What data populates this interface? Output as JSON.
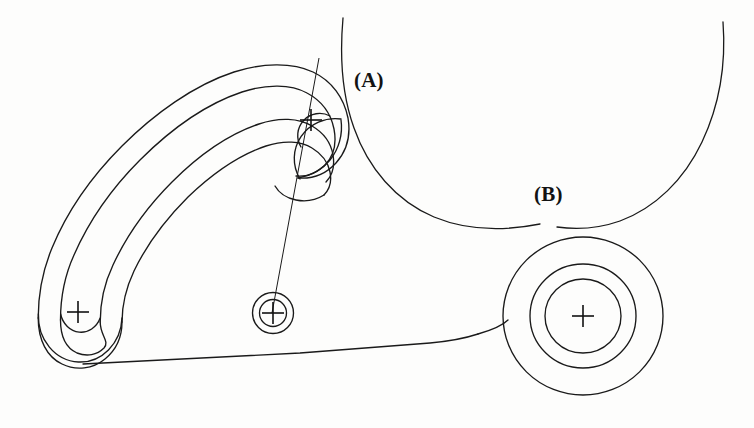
{
  "drawing": {
    "title": "Rocker arm outline with curved slot, pivot bore and circular boss",
    "background_color": "#fdfdfc",
    "line_color": "#1a1a1a",
    "line_width": 1.3,
    "thin_line_width": 1.0,
    "width": 754,
    "height": 428
  },
  "annotations": [
    {
      "id": "a",
      "text": "(A)",
      "x": 354,
      "y": 68,
      "points_to": "tangency-point-upper"
    },
    {
      "id": "b",
      "text": "(B)",
      "x": 534,
      "y": 182,
      "points_to": "tangency-point-lower"
    }
  ],
  "features": {
    "slot_left_end": {
      "center_x": 78,
      "center_y": 312,
      "outer_r": 40,
      "inner_r": 22,
      "cross_size": 11
    },
    "slot_right_end": {
      "center_x": 311,
      "center_y": 120,
      "outer_r": 41,
      "inner_r": 22,
      "cross_size": 11
    },
    "pivot_bore": {
      "center_x": 273,
      "center_y": 313,
      "outer_r": 20,
      "inner_r": 13,
      "cross_size": 11
    },
    "boss": {
      "center_x": 583,
      "center_y": 316,
      "outer_r": 78,
      "middle_r": 52,
      "inner_r": 37,
      "cross_size": 11
    },
    "construction_line": {
      "x1": 319,
      "y1": 58,
      "x2": 272,
      "y2": 313
    },
    "large_arc_left": {
      "start_x": 343,
      "start_y": 18,
      "end_x": 560,
      "end_y": 228
    },
    "large_arc_right": {
      "start_x": 723,
      "start_y": 22,
      "end_x": 600,
      "end_y": 226
    },
    "bottom_edge": {
      "x1": 80,
      "y1": 357,
      "x2": 450,
      "y2": 338
    }
  },
  "geometry_paths": {
    "outer_profile": "M 38.5 312 C 38.5 291 47 271 62 257 C 96 223 140 173 180 133 C 222 91 258 64 290 61 C 312 59 330 68 341 84 C 352 100 352 120 341 137 C 331 152 315 160 299 158",
    "slot_outer_wall": "M 285 158 C 268 154 254 141 247 124",
    "slot_inner_wall": "M 247 124 C 240 107 241 88 252 74",
    "note": "profile rendered as explicit SVG below"
  }
}
